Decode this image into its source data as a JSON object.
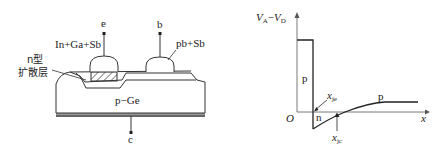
{
  "left_diagram": {
    "title": "transistor cross-section",
    "terminals": {
      "emitter": "e",
      "base": "b",
      "collector": "c"
    },
    "labels": {
      "emitter_alloy": "In+Ga+Sb",
      "base_alloy": "pb+Sb",
      "diffusion_layer_line1": "n型",
      "diffusion_layer_line2": "扩散层",
      "substrate": "p−Ge"
    }
  },
  "right_diagram": {
    "title": "impurity distribution",
    "y_axis_label_main": "V",
    "y_axis_sub_a": "A",
    "y_axis_minus": "−",
    "y_axis_label_main2": "V",
    "y_axis_sub_d": "D",
    "x_axis_label": "x",
    "origin_label": "O",
    "regions": {
      "p_left": "p",
      "n": "n",
      "p_right": "p"
    },
    "junctions": {
      "je_main": "x",
      "je_sub": "je",
      "jc_main": "x",
      "jc_sub": "jc"
    }
  }
}
